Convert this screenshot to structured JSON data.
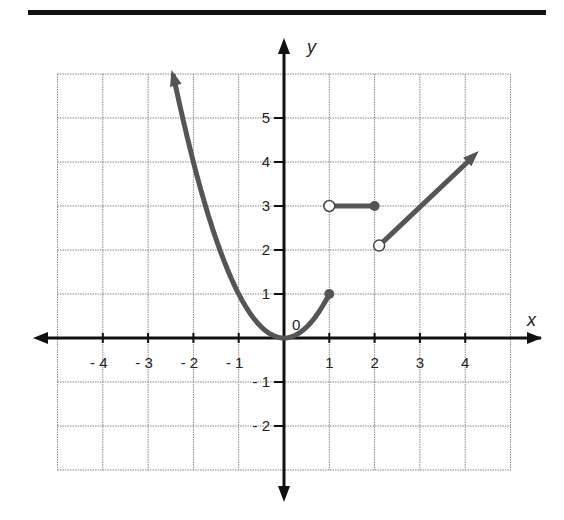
{
  "chart_data": {
    "type": "line",
    "title": "",
    "xlabel": "x",
    "ylabel": "y",
    "xlim": [
      -5.5,
      5.5
    ],
    "ylim": [
      -3.5,
      6.5
    ],
    "grid": true,
    "grid_x_range": [
      -5,
      5
    ],
    "grid_y_range": [
      -3,
      6
    ],
    "x_ticks": [
      "-4",
      "-3",
      "-2",
      "-1",
      "1",
      "2",
      "3",
      "4"
    ],
    "y_ticks": [
      "5",
      "4",
      "3",
      "2",
      "1",
      "-1",
      "-2"
    ],
    "origin_label": "0",
    "series": [
      {
        "name": "piece 1: y = x^2",
        "domain": "x <= 1",
        "points": [
          [
            -2.44,
            5.95
          ],
          [
            -2,
            4
          ],
          [
            -1,
            1
          ],
          [
            0,
            0
          ],
          [
            0.5,
            0.25
          ],
          [
            1,
            1
          ]
        ],
        "left_end": "arrow",
        "right_end": "closed",
        "right_endpoint": [
          1,
          1
        ]
      },
      {
        "name": "piece 2: y = 3",
        "domain": "1 < x <= 2",
        "points": [
          [
            1,
            3
          ],
          [
            2,
            3
          ]
        ],
        "left_end": "open",
        "right_end": "closed"
      },
      {
        "name": "piece 3: y = x",
        "domain": "x > 2",
        "points": [
          [
            2.1,
            2.1
          ],
          [
            4.3,
            4.25
          ]
        ],
        "left_end": "open",
        "right_end": "arrow"
      }
    ],
    "colors": {
      "curve": "#555555",
      "axis": "#111111",
      "grid": "#888888",
      "rule": "#111111"
    }
  }
}
